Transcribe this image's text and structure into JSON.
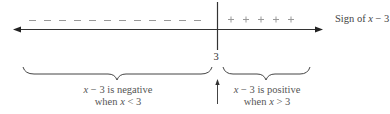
{
  "diagram": {
    "title": "Sign of x − 3",
    "title_parts": {
      "prefix": "Sign of ",
      "var": "x",
      "suffix": " − 3"
    },
    "critical_point": "3",
    "negative_symbol": "−",
    "positive_symbol": "+",
    "negative_count": 12,
    "positive_count": 5,
    "left_region": {
      "line1": {
        "var": "x",
        "rest": " − 3 is negative"
      },
      "line2": {
        "prefix": "when ",
        "var": "x",
        "rest": " < 3"
      }
    },
    "right_region": {
      "line1": {
        "var": "x",
        "rest": " − 3 is positive"
      },
      "line2": {
        "prefix": "when ",
        "var": "x",
        "rest": " > 3"
      }
    },
    "colors": {
      "line": "#333333",
      "text": "#555555",
      "signs": "#999999"
    }
  }
}
